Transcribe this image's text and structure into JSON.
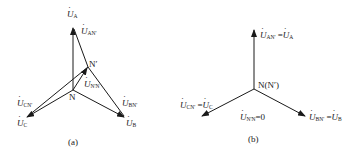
{
  "figure_a": {
    "caption": "(a)",
    "labels": {
      "UA": {
        "main": "U",
        "sub": "A"
      },
      "UAN": {
        "main": "U",
        "sub": "AN'"
      },
      "UCN": {
        "main": "U",
        "sub": "CN'"
      },
      "UC": {
        "main": "U",
        "sub": "C"
      },
      "UBN": {
        "main": "U",
        "sub": "BN'"
      },
      "UB": {
        "main": "U",
        "sub": "B"
      },
      "UNN": {
        "main": "U",
        "sub": "N'N"
      }
    },
    "nodes": {
      "N": "N",
      "Nprime": "N′"
    }
  },
  "figure_b": {
    "caption": "(b)",
    "labels": {
      "UA_main": "U",
      "UA_sub1": "AN'",
      "UA_eq": " =",
      "UA_main2": "U",
      "UA_sub2": "A",
      "UC_main": "U",
      "UC_sub1": "CN'",
      "UC_eq": " =",
      "UC_main2": "U",
      "UC_sub2": "C",
      "UB_main": "U",
      "UB_sub1": "BN'",
      "UB_eq": " =",
      "UB_main2": "U",
      "UB_sub2": "B",
      "UNN_main": "U",
      "UNN_sub": "N'N",
      "UNN_val": "=0"
    },
    "nodes": {
      "N": "N(N′)"
    }
  },
  "colors": {
    "stroke": "#1a1a1a",
    "background": "#ffffff"
  }
}
